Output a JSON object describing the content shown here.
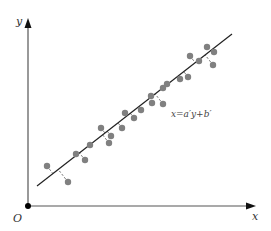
{
  "chart_data": {
    "type": "scatter",
    "title": "",
    "xlabel": "x",
    "ylabel": "y",
    "origin_label": "O",
    "grid": false,
    "legend": null,
    "fit_line": {
      "label": "x = a′y + b′",
      "start": [
        37,
        186
      ],
      "end": [
        232,
        34
      ],
      "color": "#222222"
    },
    "points_px": [
      [
        47,
        166
      ],
      [
        68,
        182
      ],
      [
        76,
        154
      ],
      [
        85,
        160
      ],
      [
        90,
        145
      ],
      [
        101,
        128
      ],
      [
        109,
        143
      ],
      [
        111,
        136
      ],
      [
        122,
        128
      ],
      [
        125,
        113
      ],
      [
        134,
        118
      ],
      [
        141,
        110
      ],
      [
        151,
        96
      ],
      [
        152,
        103
      ],
      [
        163,
        88
      ],
      [
        163,
        104
      ],
      [
        167,
        84
      ],
      [
        180,
        79
      ],
      [
        188,
        77
      ],
      [
        190,
        56
      ],
      [
        199,
        61
      ],
      [
        207,
        47
      ],
      [
        214,
        52
      ],
      [
        213,
        65
      ]
    ],
    "point_color": "#808080",
    "residuals": "dashed segments connecting each point to the fit line (horizontal-direction residuals for x on y regression)"
  },
  "axes": {
    "x_label": "x",
    "y_label": "y",
    "origin_label": "O",
    "color": "#555555"
  },
  "annotation": {
    "equation": "x=a′y+b′"
  }
}
